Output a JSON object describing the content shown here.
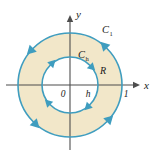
{
  "figure": {
    "background_color": "#ffffff",
    "axes": {
      "x_label": "x",
      "y_label": "y",
      "origin_label": "0",
      "axis_color": "#4d4d4d"
    },
    "labels": {
      "outer_curve": "C",
      "outer_curve_subscript": "1",
      "inner_curve": "C",
      "inner_curve_subscript": "h",
      "region": "R",
      "inner_radius_tick": "h",
      "outer_radius_tick": "1"
    },
    "colors": {
      "curve_stroke": "#3f9dbf",
      "region_fill": "#f2e7c9",
      "arrow_fill": "#3f9dbf",
      "text": "#1a1a1a"
    },
    "geometry": {
      "center_x": 70,
      "center_y": 85,
      "outer_radius": 52,
      "inner_radius": 28,
      "outer_orientation": "counterclockwise",
      "inner_orientation": "clockwise"
    }
  }
}
